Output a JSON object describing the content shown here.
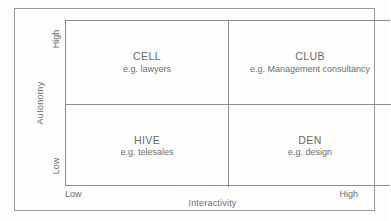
{
  "figure": {
    "type": "2x2-matrix-diagram",
    "colors": {
      "text": "#6d6d6d",
      "line": "#8d8d8d",
      "frame": "#9a9a9a",
      "background": "#fefefe"
    },
    "x_axis": {
      "title": "Interactivity",
      "low_label": "Low",
      "high_label": "High"
    },
    "y_axis": {
      "title": "Autonomy",
      "low_label": "Low",
      "high_label": "High"
    },
    "quadrants": [
      {
        "id": "cell",
        "title": "CELL",
        "example": "e.g. lawyers",
        "x_position": "low",
        "y_position": "high"
      },
      {
        "id": "club",
        "title": "CLUB",
        "example": "e.g. Management consultancy",
        "x_position": "high",
        "y_position": "high"
      },
      {
        "id": "hive",
        "title": "HIVE",
        "example": "e.g. telesales",
        "x_position": "low",
        "y_position": "low"
      },
      {
        "id": "den",
        "title": "DEN",
        "example": "e.g. design",
        "x_position": "high",
        "y_position": "low"
      }
    ]
  }
}
